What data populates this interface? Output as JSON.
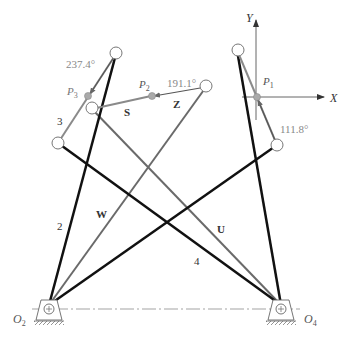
{
  "diagram": {
    "type": "linkage-mechanism",
    "colors": {
      "bar_dark": "#111111",
      "bar_gray": "#6a6a6a",
      "vector_gray": "#8a8a8a",
      "text_dark": "#222222",
      "text_gray": "#888888",
      "axis": "#555555"
    },
    "axes": {
      "x_label": "X",
      "y_label": "Y"
    },
    "points": {
      "P1": {
        "label": "P",
        "sub": "1"
      },
      "P2": {
        "label": "P",
        "sub": "2"
      },
      "P3": {
        "label": "P",
        "sub": "3"
      }
    },
    "pivots": {
      "O2": {
        "label": "O",
        "sub": "2"
      },
      "O4": {
        "label": "O",
        "sub": "4"
      }
    },
    "link_labels": {
      "link2": "2",
      "link3": "3",
      "link4": "4",
      "W": "W",
      "U": "U",
      "S": "S",
      "Z": "Z"
    },
    "angles": {
      "theta_P3": "237.4°",
      "theta_P2": "191.1°",
      "theta_P1": "111.8°"
    }
  }
}
